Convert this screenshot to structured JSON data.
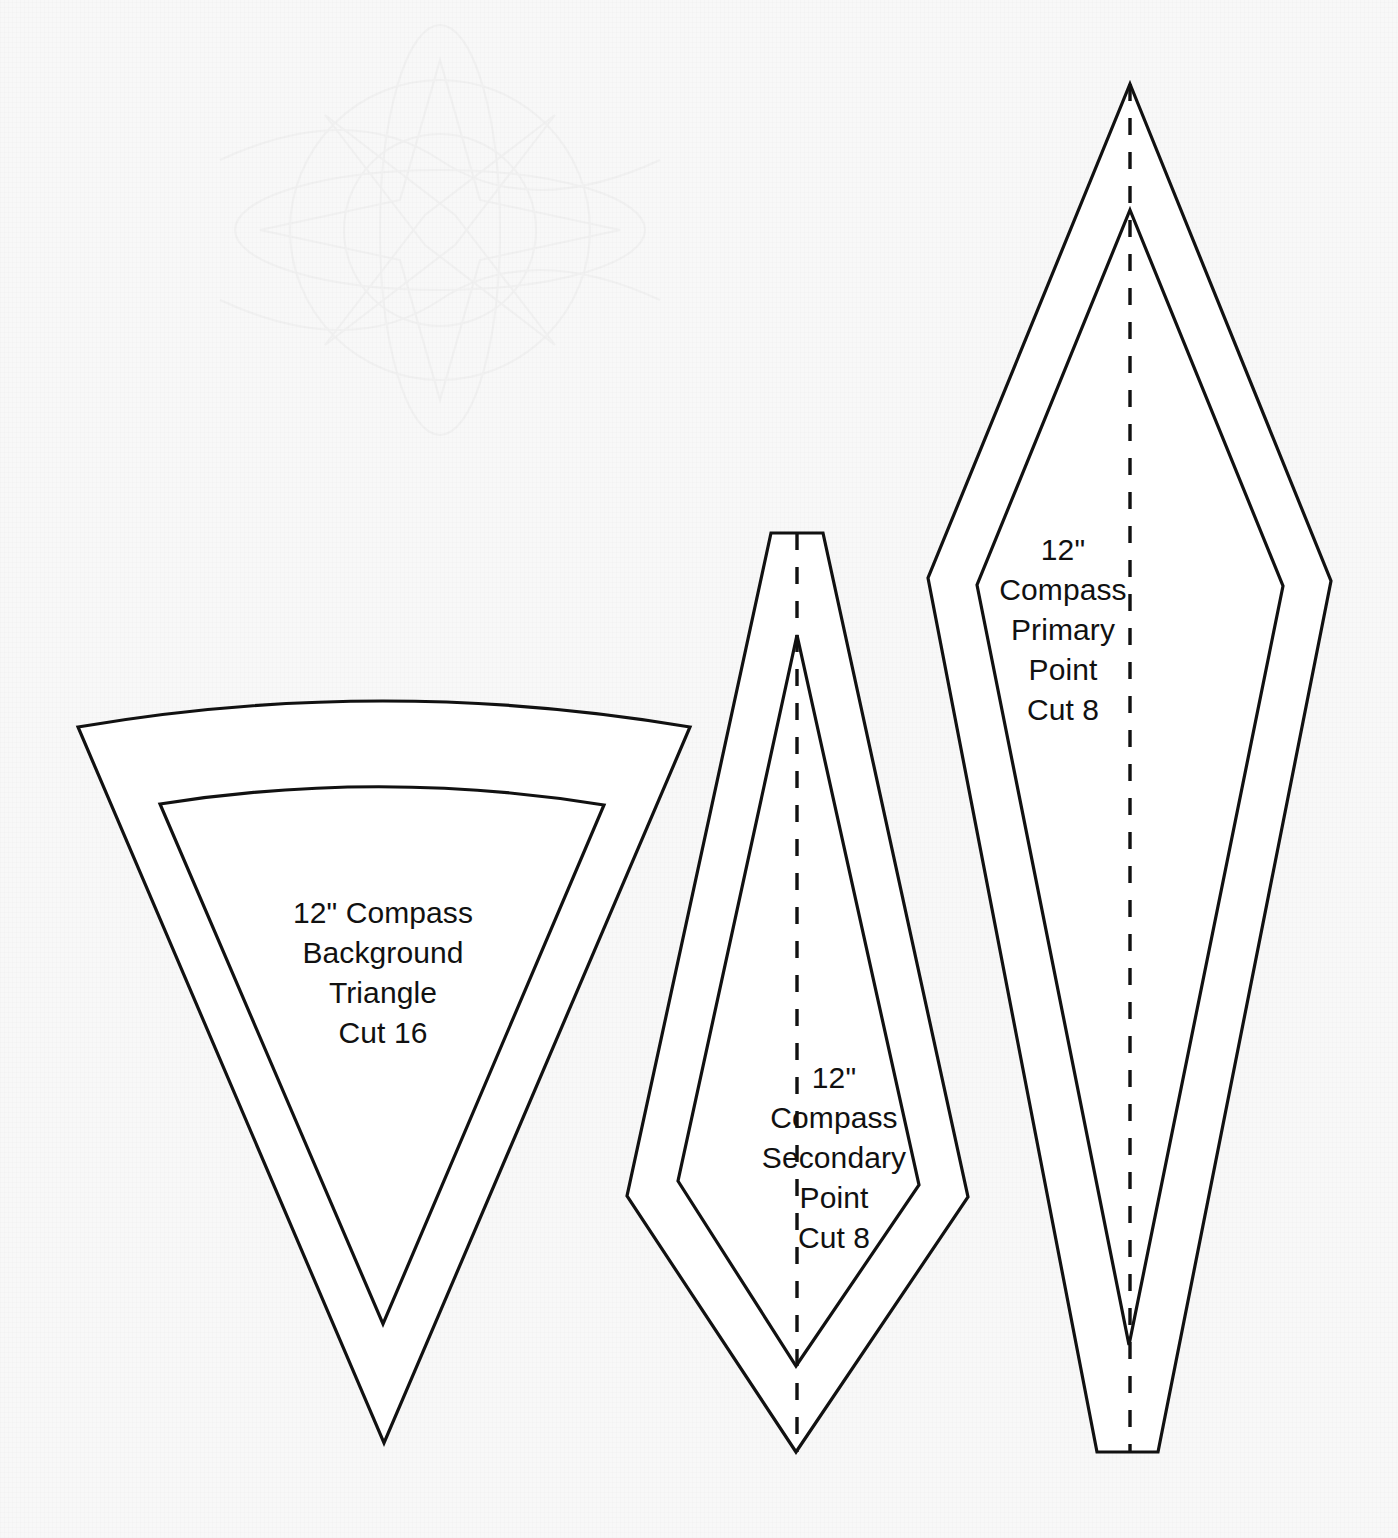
{
  "sheet": {
    "title": "12\" Mariner's Compass Quilt Block Template Sheet",
    "background_color": "#f8f8f8",
    "line_color": "#111111",
    "fill_color": "#ffffff",
    "width": 1398,
    "height": 1538
  },
  "templates": [
    {
      "id": "background-triangle",
      "name": "12\" Compass Background Triangle",
      "label_lines": [
        "12\" Compass",
        "Background",
        "Triangle",
        "Cut 16"
      ],
      "size": "12\"",
      "piece": "Compass Background Triangle",
      "cut_quantity": "Cut 16",
      "cut_count": 16,
      "shape": "curved-top wedge / pie triangle",
      "has_fold_line": false,
      "has_seam_allowance_line": true
    },
    {
      "id": "secondary-point",
      "name": "12\" Compass Secondary Point",
      "label_lines": [
        "12\"",
        "Compass",
        "Secondary",
        "Point",
        "Cut 8"
      ],
      "size": "12\"",
      "piece": "Compass Secondary Point",
      "cut_quantity": "Cut 8",
      "cut_count": 8,
      "shape": "elongated kite",
      "has_fold_line": true,
      "has_seam_allowance_line": true
    },
    {
      "id": "primary-point",
      "name": "12\" Compass Primary Point",
      "label_lines": [
        "12\"",
        "Compass",
        "Primary",
        "Point",
        "Cut 8"
      ],
      "size": "12\"",
      "piece": "Compass Primary Point",
      "cut_quantity": "Cut 8",
      "cut_count": 8,
      "shape": "elongated diamond / spike",
      "has_fold_line": true,
      "has_seam_allowance_line": true
    }
  ],
  "geometry": {
    "background_triangle": {
      "cut_path": "M 78 727 Q 382 675 690 727 L 384 1443 Z",
      "seam_path": "M 160 804 Q 382 769 604 805 L 383 1324 Z"
    },
    "secondary_point": {
      "cut_path": "M 771 533 L 823 533 L 968 1197 L 796 1452 L 627 1196 Z",
      "seam_path": "M 797 635 L 919 1185 L 796 1366 L 678 1181 Z",
      "fold_path": "M 797 533 L 797 1452"
    },
    "primary_point": {
      "cut_path": "M 1130 84 L 1331 581 L 1158 1452 L 1097 1452 L 928 578 Z",
      "seam_path": "M 1130 210 L 1283 586 L 1129 1345 L 977 585 Z",
      "fold_path": "M 1130 84 L 1130 1452"
    }
  },
  "style": {
    "cut_line_width": 3.2,
    "fold_dash": "17 17",
    "label_font_size_px": 30
  }
}
